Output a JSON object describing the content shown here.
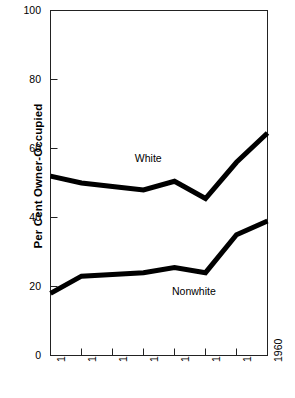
{
  "chart_data": {
    "type": "line",
    "title": "",
    "subtitle": "",
    "xlabel": "",
    "ylabel": "Per Cent Owner-Occupied",
    "x": [
      1890,
      1900,
      1910,
      1920,
      1930,
      1940,
      1950,
      1960
    ],
    "xtick_labels": [
      "1890",
      "1900",
      "1910",
      "1920",
      "1930",
      "1940",
      "1950",
      "1960"
    ],
    "ytick_labels": [
      "0",
      "20",
      "40",
      "60",
      "80",
      "100"
    ],
    "ytick_values": [
      0,
      20,
      40,
      60,
      80,
      100
    ],
    "xlim": [
      1890,
      1960
    ],
    "ylim": [
      0,
      100
    ],
    "grid": false,
    "legend_position": "inline-annotation",
    "line_color": "#000000",
    "background_color": "#ffffff",
    "series": [
      {
        "name": "White",
        "label": "White",
        "values": [
          52,
          50,
          49,
          48,
          50.5,
          45.5,
          56,
          64.5
        ]
      },
      {
        "name": "Nonwhite",
        "label": "Nonwhite",
        "values": [
          18,
          23,
          23.5,
          24,
          25.5,
          24,
          35,
          39
        ]
      }
    ],
    "annotations": [
      {
        "text": "White",
        "x": 1923,
        "y": 57
      },
      {
        "text": "Nonwhite",
        "x": 1935,
        "y": 18.5
      }
    ]
  }
}
